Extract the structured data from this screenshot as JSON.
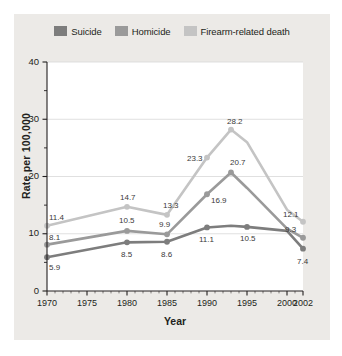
{
  "chart_data": {
    "type": "line",
    "title": "",
    "xlabel": "Year",
    "ylabel": "Rate per 100,000",
    "xlim": [
      1970,
      2002
    ],
    "ylim": [
      0,
      40
    ],
    "yticks": [
      0,
      10,
      20,
      30,
      40
    ],
    "yminorticks": [
      5,
      15,
      25,
      35
    ],
    "xticks": [
      1970,
      1975,
      1980,
      1985,
      1990,
      1995,
      2000,
      2002
    ],
    "grid": "horizontal-major",
    "legend_position": "top-center",
    "x": [
      1970,
      1980,
      1985,
      1990,
      1993,
      1995,
      2000,
      2002
    ],
    "series": [
      {
        "name": "Suicide",
        "color": "#7d7d7d",
        "values": [
          5.9,
          8.5,
          8.6,
          11.1,
          11.4,
          11.2,
          10.5,
          7.4
        ],
        "labels": [
          {
            "x": 1970,
            "y": 5.9,
            "text": "5.9"
          },
          {
            "x": 1980,
            "y": 8.5,
            "text": "8.5"
          },
          {
            "x": 1985,
            "y": 8.6,
            "text": "8.6"
          },
          {
            "x": 1990,
            "y": 11.1,
            "text": "11.1"
          },
          {
            "x": 1995,
            "y": 11.2,
            "text": "10.5"
          },
          {
            "x": 2002,
            "y": 7.4,
            "text": "7.4"
          }
        ]
      },
      {
        "name": "Homicide",
        "color": "#9a9a9a",
        "values": [
          8.1,
          10.5,
          9.9,
          16.9,
          20.7,
          18.0,
          10.9,
          9.3
        ],
        "labels": [
          {
            "x": 1970,
            "y": 8.1,
            "text": "8.1"
          },
          {
            "x": 1980,
            "y": 10.5,
            "text": "10.5"
          },
          {
            "x": 1985,
            "y": 9.9,
            "text": "9.9"
          },
          {
            "x": 1990,
            "y": 16.9,
            "text": "16.9"
          },
          {
            "x": 1993,
            "y": 20.7,
            "text": "20.7"
          },
          {
            "x": 2002,
            "y": 9.3,
            "text": "9.3"
          }
        ]
      },
      {
        "name": "Firearm-related death",
        "color": "#c4c4c4",
        "values": [
          11.4,
          14.7,
          13.3,
          23.3,
          28.2,
          26.0,
          14.2,
          12.1
        ],
        "labels": [
          {
            "x": 1970,
            "y": 11.4,
            "text": "11.4"
          },
          {
            "x": 1980,
            "y": 14.7,
            "text": "14.7"
          },
          {
            "x": 1985,
            "y": 13.3,
            "text": "13.3"
          },
          {
            "x": 1990,
            "y": 23.3,
            "text": "23.3"
          },
          {
            "x": 1993,
            "y": 28.2,
            "text": "28.2"
          },
          {
            "x": 2002,
            "y": 12.1,
            "text": "12.1"
          }
        ]
      }
    ]
  },
  "legend": {
    "items": [
      {
        "label": "Suicide",
        "color": "#7d7d7d"
      },
      {
        "label": "Homicide",
        "color": "#9a9a9a"
      },
      {
        "label": "Firearm-related death",
        "color": "#c4c4c4"
      }
    ]
  },
  "axes": {
    "ylabel": "Rate per 100,000",
    "xlabel": "Year",
    "yticks": [
      "0",
      "10",
      "20",
      "30",
      "40"
    ],
    "xticks": [
      "1970",
      "1975",
      "1980",
      "1985",
      "1990",
      "1995",
      "2000",
      "2002"
    ]
  },
  "colors": {
    "card_background": "#eceae7",
    "plot_background": "#ffffff",
    "axis": "#231f20",
    "gridline": "#d8d8d8",
    "text": "#231f20"
  }
}
